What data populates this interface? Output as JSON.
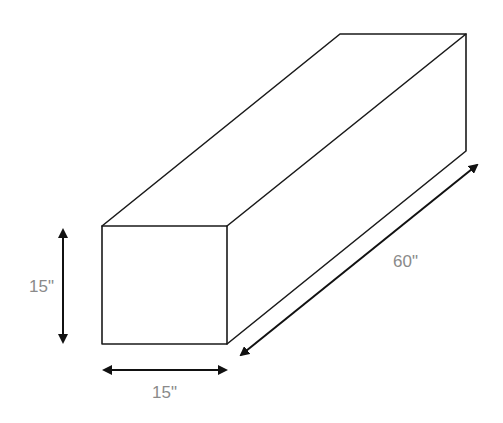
{
  "diagram": {
    "type": "rectangular prism dimension drawing",
    "dimensions": {
      "height": "15\"",
      "width": "15\"",
      "length": "60\""
    }
  }
}
